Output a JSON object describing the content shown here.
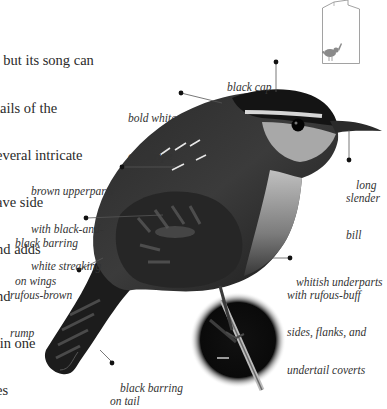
{
  "body_text": {
    "lines": [
      ", but its song can",
      "tails of the",
      "everal intricate",
      "ave side",
      "nd adds",
      "nd",
      " in one",
      "es"
    ]
  },
  "labels": {
    "black_cap": {
      "lines": [
        "black cap"
      ]
    },
    "eye_stripe": {
      "lines": [
        "bold white",
        "eye stripe"
      ]
    },
    "bill": {
      "lines": [
        "long",
        "slender",
        "bill"
      ]
    },
    "upperparts": {
      "lines": [
        "brown upperparts",
        "with black-and-",
        "white streaking"
      ]
    },
    "wings": {
      "lines": [
        "black barring",
        "on wings"
      ]
    },
    "rump": {
      "lines": [
        "rufous-brown",
        "rump"
      ]
    },
    "underparts": {
      "lines": [
        "whitish underparts",
        "with rufous-buff",
        "sides, flanks, and",
        "undertail coverts"
      ]
    },
    "tail": {
      "lines": [
        "black barring",
        "on tail"
      ]
    }
  },
  "colors": {
    "text": "#2a2a2a",
    "label": "#333333",
    "leader": "#555555",
    "thumbnail": "#8a8a8a",
    "bird_dark": "#1e1e1e",
    "bird_mid": "#4a4a4a"
  }
}
